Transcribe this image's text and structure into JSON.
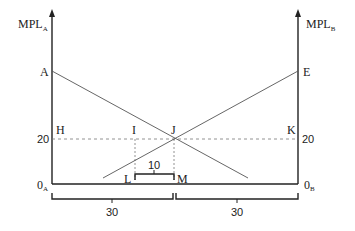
{
  "diagram": {
    "type": "labor-allocation-two-sector",
    "left_axis": {
      "label_main": "MPL",
      "label_sub": "A",
      "origin_main": "0",
      "origin_sub": "A"
    },
    "right_axis": {
      "label_main": "MPL",
      "label_sub": "B",
      "origin_main": "0",
      "origin_sub": "B"
    },
    "points": {
      "A": "A",
      "E": "E",
      "H": "H",
      "I": "I",
      "J": "J",
      "K": "K",
      "L": "L",
      "M": "M"
    },
    "value_left_20": "20",
    "value_right_20": "20",
    "lm_width_label": "10",
    "bracket_left_label": "30",
    "bracket_right_label": "30",
    "colors": {
      "line": "#222222",
      "curve": "#555555",
      "dashed": "#777777"
    }
  }
}
